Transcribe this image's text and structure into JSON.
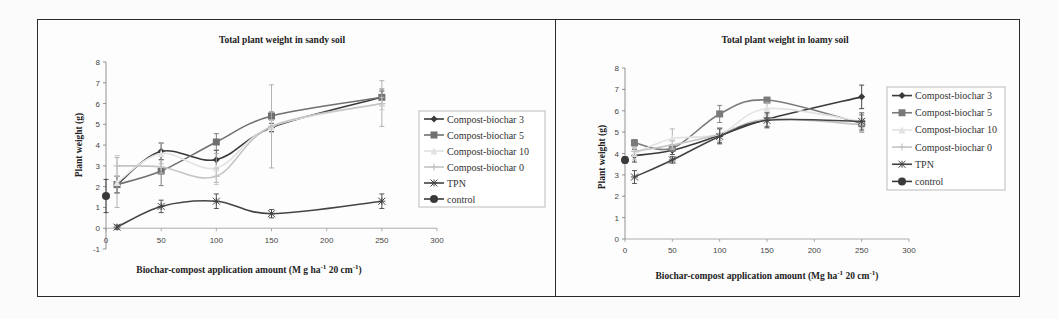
{
  "figure": {
    "panels": [
      {
        "id": "left",
        "title": "Total plant weight in sandy soil"
      },
      {
        "id": "right",
        "title": "Total plant weight in loamy soil"
      }
    ]
  },
  "chart_data": [
    {
      "type": "line",
      "title": "Total plant weight in sandy soil",
      "xlabel": "Biochar-compost application amount (Mg ha-1 20 cm-1)",
      "xlabel_parts": {
        "main": "Biochar-compost application amount (M g ha",
        "sup1": "-1",
        "mid": " 20 cm",
        "sup2": "-1",
        "end": ")"
      },
      "ylabel": "Plant weight (g)",
      "xlim": [
        0,
        300
      ],
      "ylim": [
        -1,
        8
      ],
      "xticks": [
        0,
        50,
        100,
        150,
        200,
        250,
        300
      ],
      "yticks": [
        -1,
        0,
        1,
        2,
        3,
        4,
        5,
        6,
        7,
        8
      ],
      "grid": false,
      "legend_position": "right",
      "series": [
        {
          "name": "Compost-biochar 3",
          "x": [
            10,
            50,
            100,
            150,
            250
          ],
          "values": [
            2.1,
            3.7,
            3.3,
            4.85,
            6.3
          ],
          "err": [
            0.4,
            0.4,
            0.45,
            0.2,
            0.3
          ],
          "color": "#3a3a3a",
          "marker": "diamond"
        },
        {
          "name": "Compost-biochar 5",
          "x": [
            10,
            50,
            100,
            150,
            250
          ],
          "values": [
            2.1,
            2.75,
            4.15,
            5.4,
            6.3
          ],
          "err": [
            0.4,
            0.7,
            0.4,
            0.2,
            0.4
          ],
          "color": "#707070",
          "marker": "square"
        },
        {
          "name": "Compost-biochar 10",
          "x": [
            10,
            50,
            100,
            150,
            250
          ],
          "values": [
            2.2,
            3.6,
            2.9,
            4.9,
            6.0
          ],
          "err": [
            1.2,
            0.5,
            0.7,
            2.0,
            1.1
          ],
          "color": "#e2e2e2",
          "marker": "triangle"
        },
        {
          "name": "Compost-biochar 0",
          "x": [
            10,
            50,
            100,
            150,
            250
          ],
          "values": [
            3.0,
            2.95,
            2.5,
            4.9,
            6.0
          ],
          "err": [
            0.5,
            0.3,
            0.4,
            0.3,
            0.3
          ],
          "color": "#c4c4c4",
          "marker": "cross"
        },
        {
          "name": "TPN",
          "x": [
            10,
            50,
            100,
            150,
            250
          ],
          "values": [
            0.05,
            1.05,
            1.3,
            0.7,
            1.3
          ],
          "err": [
            0.1,
            0.3,
            0.35,
            0.2,
            0.35
          ],
          "color": "#444444",
          "marker": "star"
        },
        {
          "name": "control",
          "x": [
            0
          ],
          "values": [
            1.55
          ],
          "err": [
            0.8
          ],
          "color": "#3a3a3a",
          "marker": "circle"
        }
      ]
    },
    {
      "type": "line",
      "title": "Total plant weight in loamy soil",
      "xlabel": "Biochar-compost application amount (Mg ha-1 20 cm-1)",
      "xlabel_parts": {
        "main": "Biochar-compost application amount (Mg ha",
        "sup1": "-1",
        "mid": " 20 cm",
        "sup2": "-1",
        "end": ")"
      },
      "ylabel": "Plant weight (g)",
      "xlim": [
        0,
        300
      ],
      "ylim": [
        0,
        8
      ],
      "xticks": [
        0,
        50,
        100,
        150,
        200,
        250,
        300
      ],
      "yticks": [
        0,
        1,
        2,
        3,
        4,
        5,
        6,
        7,
        8
      ],
      "grid": false,
      "legend_position": "right",
      "series": [
        {
          "name": "Compost-biochar 3",
          "x": [
            10,
            50,
            100,
            150,
            250
          ],
          "values": [
            3.9,
            4.15,
            4.85,
            5.6,
            6.65
          ],
          "err": [
            0.3,
            0.2,
            0.35,
            0.35,
            0.55
          ],
          "color": "#3a3a3a",
          "marker": "diamond"
        },
        {
          "name": "Compost-biochar 5",
          "x": [
            10,
            50,
            100,
            150,
            250
          ],
          "values": [
            4.5,
            4.25,
            5.85,
            6.5,
            5.4
          ],
          "err": [
            0.15,
            0.15,
            0.4,
            0.1,
            0.4
          ],
          "color": "#7a7a7a",
          "marker": "square"
        },
        {
          "name": "Compost-biochar 10",
          "x": [
            10,
            50,
            100,
            150,
            250
          ],
          "values": [
            4.0,
            4.7,
            4.9,
            6.1,
            5.5
          ],
          "err": [
            0.3,
            0.45,
            0.3,
            0.3,
            0.3
          ],
          "color": "#e2e2e2",
          "marker": "triangle"
        },
        {
          "name": "Compost-biochar 0",
          "x": [
            10,
            50,
            100,
            150,
            250
          ],
          "values": [
            4.1,
            4.4,
            4.9,
            5.6,
            5.35
          ],
          "err": [
            0.2,
            0.2,
            0.3,
            0.3,
            0.3
          ],
          "color": "#c4c4c4",
          "marker": "cross"
        },
        {
          "name": "TPN",
          "x": [
            10,
            50,
            100,
            150,
            250
          ],
          "values": [
            2.9,
            3.7,
            4.8,
            5.55,
            5.5
          ],
          "err": [
            0.3,
            0.15,
            0.35,
            0.35,
            0.4
          ],
          "color": "#444444",
          "marker": "star"
        },
        {
          "name": "control",
          "x": [
            0
          ],
          "values": [
            3.7
          ],
          "err": [
            0.15
          ],
          "color": "#3a3a3a",
          "marker": "circle"
        }
      ]
    }
  ]
}
